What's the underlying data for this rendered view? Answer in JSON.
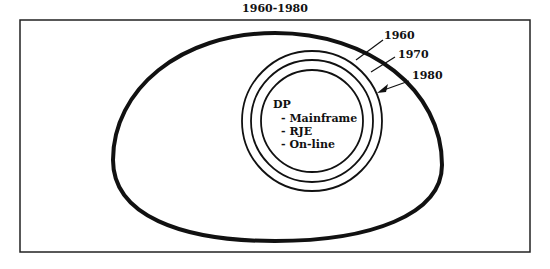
{
  "title": "1960-1980",
  "diagram": {
    "rings": [
      {
        "label": "1960"
      },
      {
        "label": "1970"
      },
      {
        "label": "1980"
      }
    ],
    "core": {
      "heading": "DP",
      "items": [
        "- Mainframe",
        "- RJE",
        "- On-line"
      ]
    }
  }
}
